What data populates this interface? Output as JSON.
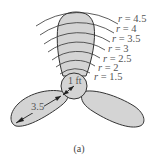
{
  "figure": {
    "caption": "(a)",
    "hub_label": "1 ft",
    "blade_length_label": "3.5",
    "radius_labels": [
      {
        "var": "r",
        "eq": " = ",
        "value": "4.5"
      },
      {
        "var": "r",
        "eq": " = ",
        "value": "4"
      },
      {
        "var": "r",
        "eq": " = ",
        "value": "3.5"
      },
      {
        "var": "r",
        "eq": " = ",
        "value": "3"
      },
      {
        "var": "r",
        "eq": " = ",
        "value": "2.5"
      },
      {
        "var": "r",
        "eq": " = ",
        "value": "2"
      },
      {
        "var": "r",
        "eq": " = ",
        "value": "1.5"
      }
    ],
    "colors": {
      "blade_fill": "#d4d4d4",
      "outline": "#333333",
      "text": "#555555"
    }
  }
}
